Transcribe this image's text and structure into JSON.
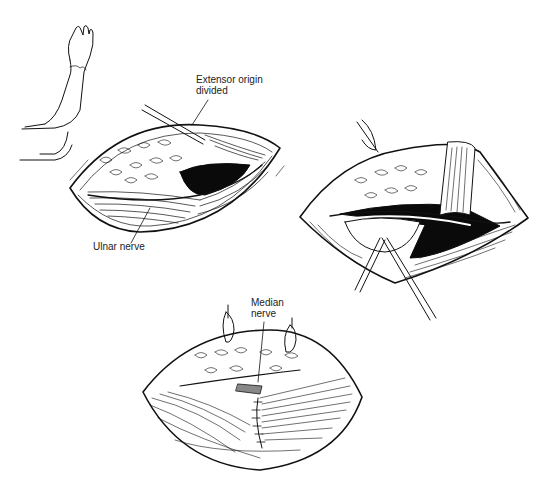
{
  "figure": {
    "panels": [
      {
        "id": "panel-1",
        "description": "Arm position and lateral incision with extensor origin divided",
        "labels": [
          {
            "text_line1": "Extensor origin",
            "text_line2": "divided"
          },
          {
            "text_line1": "Ulnar nerve"
          }
        ]
      },
      {
        "id": "panel-2",
        "description": "Retracted exposure with instruments"
      },
      {
        "id": "panel-3",
        "description": "Exposure with median nerve and sutured muscle",
        "labels": [
          {
            "text_line1": "Median",
            "text_line2": "nerve"
          }
        ]
      }
    ],
    "colors": {
      "line": "#111111",
      "background": "#ffffff",
      "cavity": "#0a0a0a"
    }
  }
}
